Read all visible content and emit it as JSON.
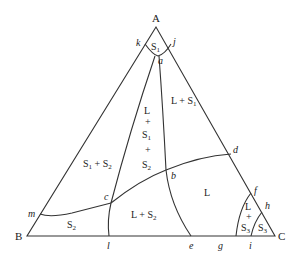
{
  "diagram": {
    "type": "ternary-phase-diagram",
    "vertices": {
      "A": {
        "label": "A"
      },
      "B": {
        "label": "B"
      },
      "C": {
        "label": "C"
      }
    },
    "points": {
      "a": "a",
      "b": "b",
      "c": "c",
      "d": "d",
      "e": "e",
      "f": "f",
      "g": "g",
      "h": "h",
      "i": "i",
      "j": "j",
      "k": "k",
      "l": "l",
      "m": "m"
    },
    "regions": {
      "s1": {
        "main": "S",
        "sub": "1"
      },
      "l_plus_s1": {
        "text": "L + S",
        "sub": "1"
      },
      "l_s1_s2": {
        "l": "L",
        "plus1": "+",
        "s1": "S",
        "s1_sub": "1",
        "plus2": "+",
        "s2": "S",
        "s2_sub": "2"
      },
      "s1_plus_s2": {
        "s1": "S",
        "s1_sub": "1",
        "plus": " + S",
        "s2_sub": "2"
      },
      "liquid": {
        "text": "L"
      },
      "l_plus_s2": {
        "text": "L + S",
        "sub": "2"
      },
      "s2": {
        "main": "S",
        "sub": "2"
      },
      "l_plus_s3": {
        "l": "L",
        "plus": "+",
        "s": "S",
        "sub": "3"
      },
      "s3": {
        "main": "S",
        "sub": "3"
      }
    }
  }
}
